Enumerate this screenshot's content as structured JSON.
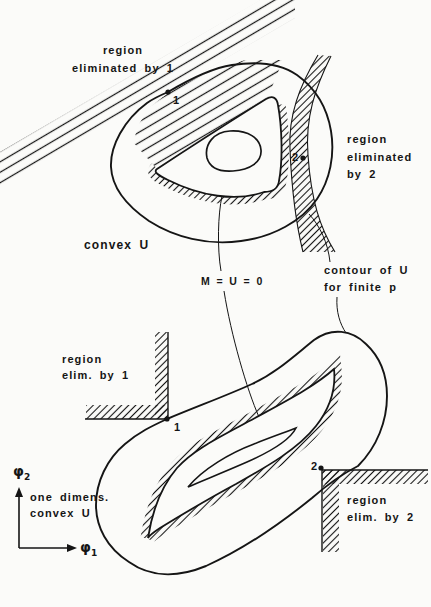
{
  "page": {
    "width": 431,
    "height": 607,
    "paper_color": "#fbfbf9",
    "ink_color": "#151515"
  },
  "top_diagram": {
    "region1_line1": "region",
    "region1_line2": "eliminated by 1",
    "region2_line1": "region",
    "region2_line2": "eliminated",
    "region2_line3": "by 2",
    "convex_label": "convex U",
    "point1": "1",
    "point2": "2"
  },
  "annotations": {
    "m_label": "M = U = 0",
    "contour_line1": "contour of U",
    "contour_line2": "for finite p"
  },
  "bottom_diagram": {
    "region1_line1": "region",
    "region1_line2": "elim. by 1",
    "region2_line1": "region",
    "region2_line2": "elim. by 2",
    "dimens_line1": "one dimens.",
    "dimens_line2": "convex U",
    "point1": "1",
    "point2": "2"
  },
  "axes": {
    "phi_base": "φ",
    "phi1_sub": "1",
    "phi2_sub": "2"
  }
}
